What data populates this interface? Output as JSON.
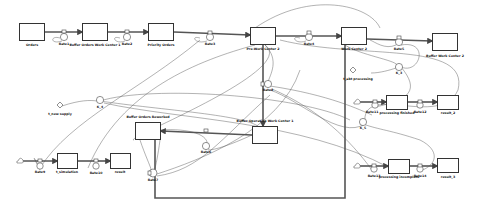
{
  "diagram": {
    "type": "stock-and-flow",
    "stocks": [
      {
        "id": "orders",
        "label": "Orders",
        "x": 19,
        "y": 23,
        "w": 26,
        "h": 18
      },
      {
        "id": "bowc1",
        "label": "Buffer Orders Work Center 1",
        "x": 82,
        "y": 23,
        "w": 26,
        "h": 18
      },
      {
        "id": "priority",
        "label": "Priority Orders",
        "x": 148,
        "y": 23,
        "w": 26,
        "h": 18
      },
      {
        "id": "prewc2",
        "label": "Pre-Work Center 2",
        "x": 250,
        "y": 27,
        "w": 26,
        "h": 18
      },
      {
        "id": "wc2",
        "label": "Work Center 2",
        "x": 341,
        "y": 27,
        "w": 26,
        "h": 18
      },
      {
        "id": "bwc2",
        "label": "Buffer Work Center 2",
        "x": 432,
        "y": 33,
        "w": 26,
        "h": 18
      },
      {
        "id": "bor",
        "label": "Buffer Orders Reworked",
        "x": 135,
        "y": 122,
        "w": 26,
        "h": 18
      },
      {
        "id": "bowc1b",
        "label": "Buffer Operation Work Center 1",
        "x": 252,
        "y": 126,
        "w": 26,
        "h": 18
      },
      {
        "id": "pfinished",
        "label": "processing finished",
        "x": 386,
        "y": 95,
        "w": 22,
        "h": 15
      },
      {
        "id": "result2",
        "label": "result_2",
        "x": 437,
        "y": 95,
        "w": 22,
        "h": 15
      },
      {
        "id": "pincomplete",
        "label": "processing incomplete",
        "x": 388,
        "y": 159,
        "w": 22,
        "h": 15
      },
      {
        "id": "result3",
        "label": "result_3",
        "x": 437,
        "y": 158,
        "w": 22,
        "h": 15
      },
      {
        "id": "tsim",
        "label": "t_simulation",
        "x": 57,
        "y": 153,
        "w": 21,
        "h": 16
      },
      {
        "id": "result",
        "label": "result",
        "x": 110,
        "y": 153,
        "w": 21,
        "h": 16
      }
    ],
    "rates": [
      {
        "id": "rate1",
        "label": "Rate1",
        "x": 64,
        "y": 41
      },
      {
        "id": "rate2",
        "label": "Rate2",
        "x": 127,
        "y": 41
      },
      {
        "id": "rate3",
        "label": "Rate3",
        "x": 210,
        "y": 41
      },
      {
        "id": "rate4",
        "label": "Rate4",
        "x": 309,
        "y": 41
      },
      {
        "id": "rate5",
        "label": "Rate5",
        "x": 399,
        "y": 45
      },
      {
        "id": "rate6",
        "label": "Rate6",
        "x": 206,
        "y": 148
      },
      {
        "id": "rate7",
        "label": "Rate7",
        "x": 153,
        "y": 176
      },
      {
        "id": "rate8",
        "label": "Rate8",
        "x": 268,
        "y": 85
      },
      {
        "id": "rate9",
        "label": "Rate9",
        "x": 40,
        "y": 170
      },
      {
        "id": "rate10",
        "label": "Rate10",
        "x": 96,
        "y": 170
      },
      {
        "id": "rate11",
        "label": "Rate11",
        "x": 375,
        "y": 107
      },
      {
        "id": "rate12",
        "label": "Rate12",
        "x": 420,
        "y": 107
      },
      {
        "id": "rate13",
        "label": "Rate13",
        "x": 374,
        "y": 171
      },
      {
        "id": "rate14",
        "label": "Rate14",
        "x": 420,
        "y": 171
      }
    ],
    "auxiliaries": [
      {
        "id": "k3",
        "label": "K_3",
        "x": 399,
        "y": 67
      },
      {
        "id": "k4",
        "label": "K_4",
        "x": 100,
        "y": 101
      },
      {
        "id": "k5",
        "label": "K_5",
        "x": 363,
        "y": 121
      }
    ],
    "constants": [
      {
        "id": "tnewsupply",
        "label": "t_new supply",
        "x": 60,
        "y": 105
      },
      {
        "id": "tabtprocessing",
        "label": "t_abt processing",
        "x": 353,
        "y": 72
      }
    ]
  },
  "colors": {
    "line": "#444444",
    "pipe": "#555555",
    "stock_border": "#333333",
    "background": "#ffffff"
  }
}
